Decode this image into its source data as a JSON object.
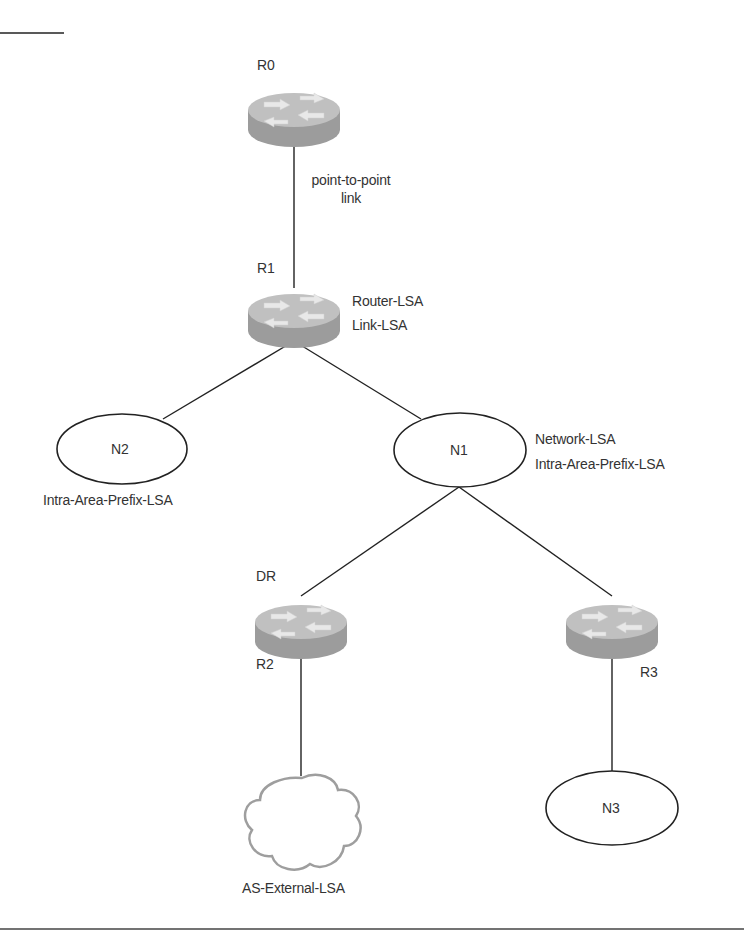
{
  "diagram": {
    "routers": [
      {
        "id": "R0",
        "label": "R0"
      },
      {
        "id": "R1",
        "label": "R1"
      },
      {
        "id": "R2",
        "label": "R2",
        "role_label": "DR"
      },
      {
        "id": "R3",
        "label": "R3"
      }
    ],
    "networks": [
      {
        "id": "N1",
        "label": "N1"
      },
      {
        "id": "N2",
        "label": "N2"
      },
      {
        "id": "N3",
        "label": "N3"
      }
    ],
    "link_label_line1": "point-to-point",
    "link_label_line2": "link",
    "annotations": {
      "r1_lsa_1": "Router-LSA",
      "r1_lsa_2": "Link-LSA",
      "n1_lsa_1": "Network-LSA",
      "n1_lsa_2": "Intra-Area-Prefix-LSA",
      "n2_lsa": "Intra-Area-Prefix-LSA",
      "cloud_lsa": "AS-External-LSA"
    },
    "colors": {
      "line": "#222222",
      "router_top": "#bdbdbd",
      "router_side": "#9a9a9a",
      "router_arrows": "#e6e6e6",
      "cloud_stroke": "#9e9e9e"
    }
  }
}
